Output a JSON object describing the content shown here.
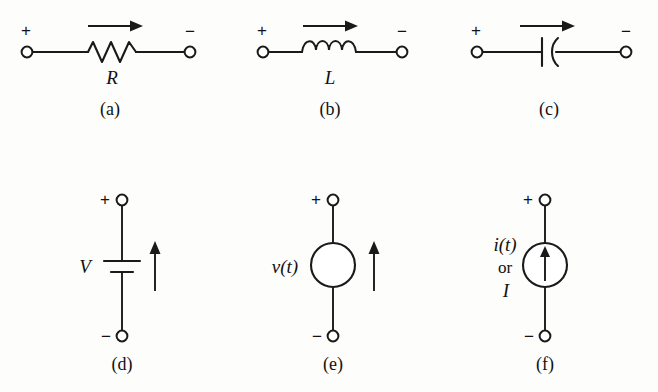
{
  "figure": {
    "background_color": "#fdfdfc",
    "ink_color": "#1a1a1a",
    "panels": [
      {
        "id": "a",
        "caption": "(a)",
        "element": "resistor",
        "element_label": "R",
        "plus_sign": "+",
        "minus_sign": "−",
        "current_arrow": "right-arrow"
      },
      {
        "id": "b",
        "caption": "(b)",
        "element": "inductor",
        "element_label": "L",
        "plus_sign": "+",
        "minus_sign": "−",
        "current_arrow": "right-arrow"
      },
      {
        "id": "c",
        "caption": "(c)",
        "element": "capacitor",
        "element_label": "",
        "plus_sign": "+",
        "minus_sign": "−",
        "current_arrow": "right-arrow"
      },
      {
        "id": "d",
        "caption": "(d)",
        "element": "battery",
        "element_label": "V",
        "plus_sign": "+",
        "minus_sign": "−",
        "current_arrow": "up-arrow"
      },
      {
        "id": "e",
        "caption": "(e)",
        "element": "voltage-source",
        "element_label": "v(t)",
        "plus_sign": "+",
        "minus_sign": "−",
        "current_arrow": "up-arrow"
      },
      {
        "id": "f",
        "caption": "(f)",
        "element": "current-source",
        "element_label_line1": "i(t)",
        "element_label_line2": "or",
        "element_label_line3": "I",
        "plus_sign": "+",
        "minus_sign": "−",
        "current_arrow": "up-arrow-inside-circle"
      }
    ]
  }
}
